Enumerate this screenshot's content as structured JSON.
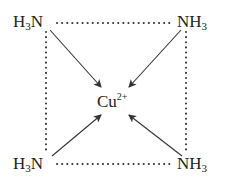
{
  "diagram": {
    "center": {
      "element": "Cu",
      "charge": "2+"
    },
    "ligands": [
      {
        "position": "top-left",
        "prefix": "H",
        "sub": "3",
        "atom": "N",
        "order": "H3N"
      },
      {
        "position": "top-right",
        "atom": "N",
        "prefix": "H",
        "sub": "3",
        "order": "NH3"
      },
      {
        "position": "bottom-left",
        "prefix": "H",
        "sub": "3",
        "atom": "N",
        "order": "H3N"
      },
      {
        "position": "bottom-right",
        "atom": "N",
        "prefix": "H",
        "sub": "3",
        "order": "NH3"
      }
    ],
    "bonds": "coordinate bonds (arrows) from N to Cu",
    "edges": "dotted square connecting ligands",
    "colors": {
      "ink": "#222222",
      "line": "#333333",
      "background": "#ffffff"
    }
  }
}
